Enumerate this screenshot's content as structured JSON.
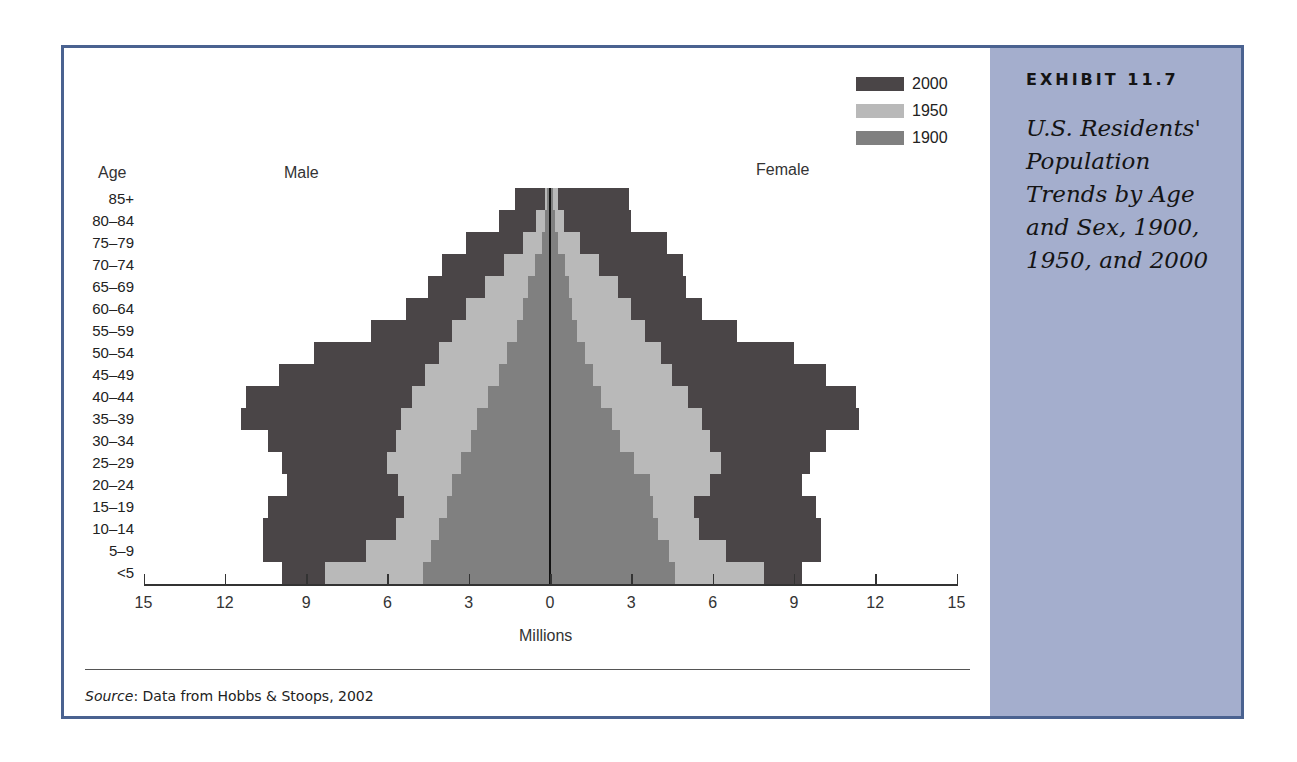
{
  "exhibit": {
    "label": "EXHIBIT 11.7",
    "title": "U.S. Residents' Population Trends by Age and Sex, 1900, 1950, and 2000"
  },
  "source": {
    "prefix": "Source",
    "text": ": Data from Hobbs & Stoops, 2002"
  },
  "colors": {
    "frame": "#4a6290",
    "sidebar": "#a4aecd",
    "y2000": "#4a4547",
    "y1950": "#b9b9b9",
    "y1900": "#808080"
  },
  "chart_data": {
    "type": "bar",
    "subtype": "population-pyramid",
    "title": "U.S. Residents' Population Trends by Age and Sex, 1900, 1950, and 2000",
    "xlabel": "Millions",
    "ylabel": "Age",
    "left_label": "Male",
    "right_label": "Female",
    "xlim": [
      -15,
      15
    ],
    "x_ticks": [
      15,
      12,
      9,
      6,
      3,
      0,
      3,
      6,
      9,
      12,
      15
    ],
    "legend": [
      "2000",
      "1950",
      "1900"
    ],
    "legend_position": "top-right",
    "grid": false,
    "categories": [
      "85+",
      "80–84",
      "75–79",
      "70–74",
      "65–69",
      "60–64",
      "55–59",
      "50–54",
      "45–49",
      "40–44",
      "35–39",
      "30–34",
      "25–29",
      "20–24",
      "15–19",
      "10–14",
      "5–9",
      "<5"
    ],
    "series": [
      {
        "name": "2000",
        "sex": "Male",
        "values": [
          1.3,
          1.9,
          3.1,
          4.0,
          4.5,
          5.3,
          6.6,
          8.7,
          10.0,
          11.2,
          11.4,
          10.4,
          9.9,
          9.7,
          10.4,
          10.6,
          10.6,
          9.9
        ]
      },
      {
        "name": "1950",
        "sex": "Male",
        "values": [
          0.2,
          0.5,
          1.0,
          1.7,
          2.4,
          3.1,
          3.6,
          4.1,
          4.6,
          5.1,
          5.5,
          5.7,
          6.0,
          5.6,
          5.4,
          5.7,
          6.8,
          8.3
        ]
      },
      {
        "name": "1900",
        "sex": "Male",
        "values": [
          0.1,
          0.2,
          0.3,
          0.55,
          0.8,
          1.0,
          1.2,
          1.6,
          1.9,
          2.3,
          2.7,
          2.9,
          3.3,
          3.6,
          3.8,
          4.1,
          4.4,
          4.7
        ]
      },
      {
        "name": "2000",
        "sex": "Female",
        "values": [
          2.9,
          3.0,
          4.3,
          4.9,
          5.0,
          5.6,
          6.9,
          9.0,
          10.2,
          11.3,
          11.4,
          10.2,
          9.6,
          9.3,
          9.8,
          10.0,
          10.0,
          9.3
        ]
      },
      {
        "name": "1950",
        "sex": "Female",
        "values": [
          0.3,
          0.5,
          1.1,
          1.8,
          2.5,
          3.0,
          3.5,
          4.1,
          4.5,
          5.1,
          5.6,
          5.9,
          6.3,
          5.9,
          5.3,
          5.5,
          6.5,
          7.9
        ]
      },
      {
        "name": "1900",
        "sex": "Female",
        "values": [
          0.1,
          0.2,
          0.3,
          0.55,
          0.7,
          0.8,
          1.0,
          1.3,
          1.6,
          1.9,
          2.3,
          2.6,
          3.1,
          3.7,
          3.8,
          4.0,
          4.4,
          4.6
        ]
      }
    ]
  }
}
